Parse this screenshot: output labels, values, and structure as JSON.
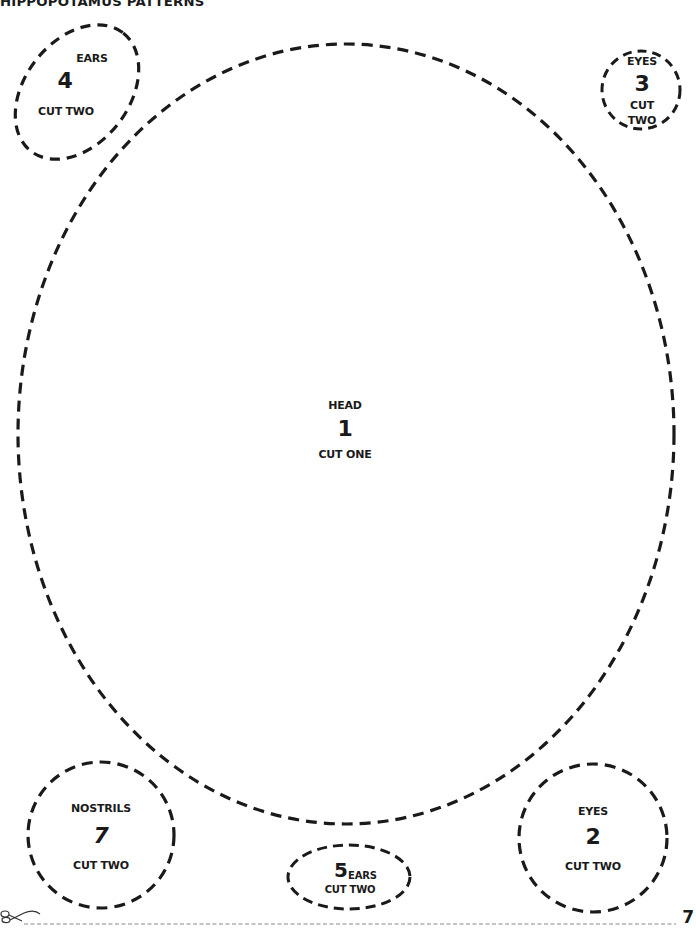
{
  "document": {
    "title": "HIPPOPOTAMUS PATTERNS",
    "page_number": "7",
    "cut_line_icon": "scissors-icon"
  },
  "pieces": {
    "head": {
      "name": "HEAD",
      "number": "1",
      "instruction": "CUT ONE"
    },
    "eyes_large": {
      "name": "EYES",
      "number": "2",
      "instruction": "CUT TWO"
    },
    "eyes_small": {
      "name": "EYES",
      "number": "3",
      "instruction_line1": "CUT",
      "instruction_line2": "TWO"
    },
    "ears_large": {
      "name": "EARS",
      "number": "4",
      "instruction": "CUT TWO"
    },
    "ears_small": {
      "name": "EARS",
      "number": "5",
      "instruction": "CUT TWO"
    },
    "nostrils": {
      "name": "NOSTRILS",
      "number": "7",
      "instruction": "CUT TWO"
    }
  },
  "colors": {
    "ink": "#1a1a1a",
    "cut_line": "#888888",
    "background": "#ffffff"
  }
}
